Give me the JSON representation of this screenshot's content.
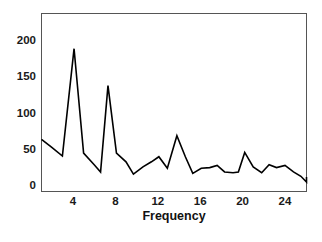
{
  "chart_data": {
    "type": "line",
    "title": "",
    "subtitle": "",
    "xlabel": "Frequency",
    "ylabel": "",
    "xlim": [
      1,
      28
    ],
    "ylim": [
      0,
      225
    ],
    "grid": false,
    "legend": null,
    "line_color": "#000000",
    "frame_color": "#555555",
    "background": "#ffffff",
    "xticks": [
      4,
      8,
      12,
      16,
      20,
      24
    ],
    "xtick_labels": [
      "4",
      "8",
      "12",
      "16",
      "20",
      "24"
    ],
    "yticks": [
      0,
      50,
      100,
      150,
      200
    ],
    "ytick_labels": [
      "0",
      "50",
      "100",
      "150",
      "200"
    ],
    "series": [
      {
        "name": "spectral density",
        "x": [
          1.0,
          2.0,
          3.0,
          4.1,
          5.0,
          6.0,
          6.6,
          7.3,
          8.1,
          9.0,
          9.7,
          10.6,
          11.4,
          12.1,
          12.9,
          13.8,
          14.6,
          15.3,
          16.1,
          16.9,
          17.6,
          18.3,
          19.1,
          19.6,
          20.2,
          21.0,
          21.8,
          22.5,
          23.2,
          24.0,
          24.8,
          25.5,
          26.2,
          27.0
        ],
        "y": [
          63,
          52,
          40,
          188,
          44,
          28,
          18,
          137,
          44,
          32,
          15,
          25,
          32,
          39,
          23,
          68,
          39,
          16,
          23,
          24,
          27,
          18,
          17,
          18,
          45,
          25,
          17,
          28,
          24,
          27,
          18,
          12,
          4,
          11
        ]
      }
    ]
  },
  "axes": {
    "frame_label": "plot-frame",
    "x_axis_title": "Frequency"
  }
}
